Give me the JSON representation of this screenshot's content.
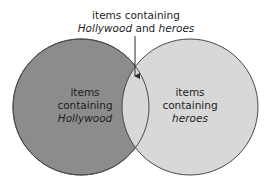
{
  "diagram": {
    "type": "venn",
    "colors": {
      "background": "#ffffff",
      "left_fill": "#8c8c8c",
      "right_fill": "#d8d8d8",
      "outline": "#4a4a4a",
      "text": "#1e1e1e"
    },
    "intersection_label": {
      "line1": "items containing",
      "line2_italic_a": "Hollywood",
      "line2_connector": " and ",
      "line2_italic_b": "heroes"
    },
    "sets": [
      {
        "id": "left",
        "line1": "items",
        "line2": "containing",
        "line3": "Hollywood"
      },
      {
        "id": "right",
        "line1": "items",
        "line2": "containing",
        "line3": "heroes"
      }
    ]
  }
}
